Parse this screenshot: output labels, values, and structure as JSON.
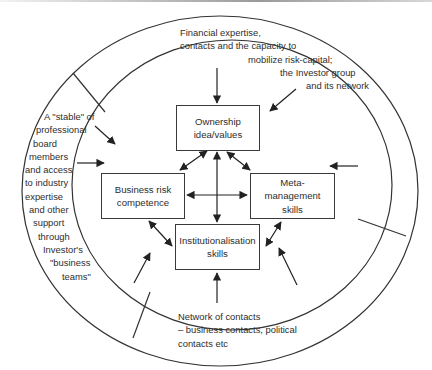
{
  "diagram": {
    "colors": {
      "line": "#333333",
      "text": "#2e2e2e",
      "background": "#ffffff"
    },
    "center_boxes": {
      "ownership": [
        "Ownership",
        "idea/values"
      ],
      "business_risk": [
        "Business risk",
        "competence"
      ],
      "meta_management": [
        "Meta-",
        "management",
        "skills"
      ],
      "institutionalisation": [
        "Institutionalisation",
        "skills"
      ]
    },
    "outer_segments": {
      "top": [
        "Financial expertise,",
        "contacts and the capacity to",
        "mobilize risk-capital;",
        "the Investor group",
        "and its network"
      ],
      "left": [
        "A \"stable\" of",
        "professional",
        "board",
        "members",
        "and access",
        "to industry",
        "expertise",
        "and other",
        "support",
        "through",
        "Investor's",
        "\"business",
        "teams\""
      ],
      "bottom": [
        "Network of contacts",
        "– business contacts, political",
        "contacts etc"
      ]
    }
  }
}
